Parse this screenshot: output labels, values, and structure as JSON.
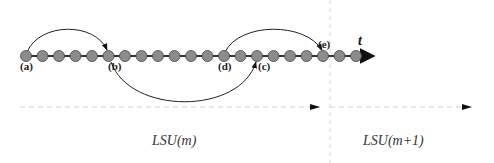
{
  "diagram": {
    "axis_label": "t",
    "node_labels": {
      "a": "(a)",
      "b": "(b)",
      "c": "(c)",
      "d": "(d)",
      "e": "(e)"
    },
    "segments": [
      {
        "label": "LSU(m)"
      },
      {
        "label": "LSU(m+1)"
      }
    ],
    "node_count": 21,
    "arcs": [
      {
        "from": "a",
        "to": "b",
        "direction": "above"
      },
      {
        "from": "b",
        "to": "c",
        "direction": "below"
      },
      {
        "from": "d",
        "to": "e",
        "direction": "above"
      }
    ],
    "colors": {
      "node_fill": "#8c8c8c",
      "line": "#333333",
      "dashed": "#cccccc"
    }
  }
}
